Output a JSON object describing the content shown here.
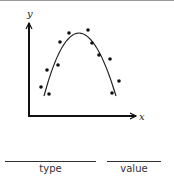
{
  "diagram": {
    "axis_labels": {
      "x": "x",
      "y": "y"
    },
    "colors": {
      "axis": "#111111",
      "curve": "#222222",
      "points": "#111111",
      "border": "#9a9a9a"
    },
    "curve": {
      "type": "downward parabola",
      "path": "M 44 96 Q 78 -30 116 96"
    },
    "points": [
      {
        "x": 41,
        "y": 87
      },
      {
        "x": 49,
        "y": 94
      },
      {
        "x": 47,
        "y": 70
      },
      {
        "x": 58,
        "y": 65
      },
      {
        "x": 60,
        "y": 42
      },
      {
        "x": 69,
        "y": 33
      },
      {
        "x": 88,
        "y": 30
      },
      {
        "x": 92,
        "y": 43
      },
      {
        "x": 99,
        "y": 55
      },
      {
        "x": 110,
        "y": 59
      },
      {
        "x": 119,
        "y": 81
      },
      {
        "x": 112,
        "y": 93
      }
    ]
  },
  "answer_fields": [
    {
      "label": "type"
    },
    {
      "label": "value"
    }
  ]
}
